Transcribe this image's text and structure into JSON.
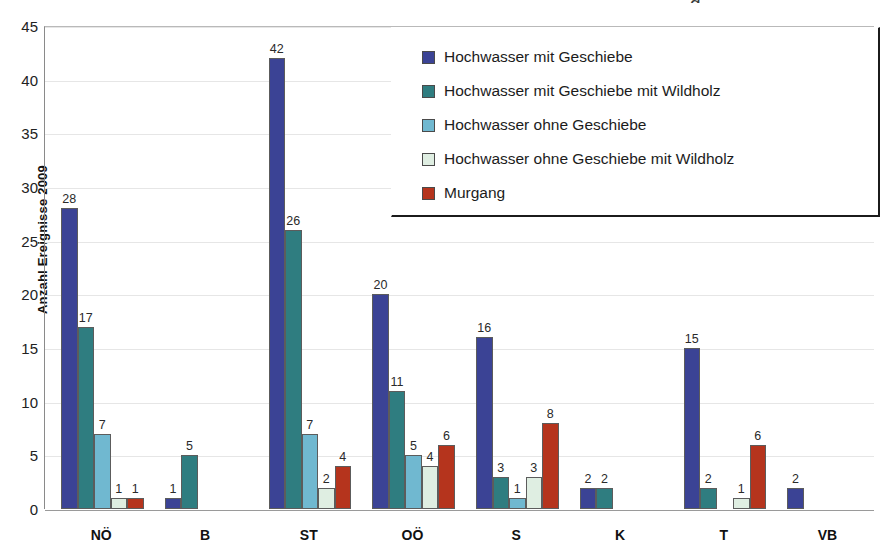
{
  "chart_data": {
    "type": "bar",
    "title": "",
    "xlabel": "",
    "ylabel": "Anzahl Ereignisse 2009",
    "ylim": [
      0,
      45
    ],
    "ytick_step": 5,
    "yticks": [
      45,
      40,
      35,
      30,
      25,
      20,
      15,
      10,
      5,
      0
    ],
    "grid": true,
    "legend_position": "top-right",
    "categories": [
      "NÖ",
      "B",
      "ST",
      "OÖ",
      "S",
      "K",
      "T",
      "VB"
    ],
    "series": [
      {
        "name": "Hochwasser mit Geschiebe",
        "color": "#3b4395",
        "values": [
          28,
          1,
          42,
          20,
          16,
          2,
          15,
          2
        ]
      },
      {
        "name": "Hochwasser mit Geschiebe mit Wildholz",
        "color": "#2f7d80",
        "values": [
          17,
          5,
          26,
          11,
          3,
          2,
          2,
          null
        ]
      },
      {
        "name": "Hochwasser ohne Geschiebe",
        "color": "#70b8d0",
        "values": [
          7,
          null,
          7,
          5,
          1,
          null,
          null,
          null
        ]
      },
      {
        "name": "Hochwasser ohne Geschiebe mit Wildholz",
        "color": "#dfeee2",
        "values": [
          1,
          null,
          2,
          4,
          3,
          null,
          1,
          null
        ]
      },
      {
        "name": "Murgang",
        "color": "#b5341d",
        "values": [
          1,
          null,
          4,
          6,
          8,
          null,
          6,
          null
        ]
      }
    ]
  },
  "legend": {
    "items": [
      {
        "label": "Hochwasser mit Geschiebe",
        "color": "#3b4395"
      },
      {
        "label": "Hochwasser mit Geschiebe mit Wildholz",
        "color": "#2f7d80"
      },
      {
        "label": "Hochwasser ohne Geschiebe",
        "color": "#70b8d0"
      },
      {
        "label": "Hochwasser ohne Geschiebe mit Wildholz",
        "color": "#dfeee2"
      },
      {
        "label": "Murgang",
        "color": "#b5341d"
      }
    ]
  },
  "axes": {
    "y_title": "Anzahl Ereignisse 2009"
  },
  "artifact": {
    "top_glyph": "g"
  }
}
